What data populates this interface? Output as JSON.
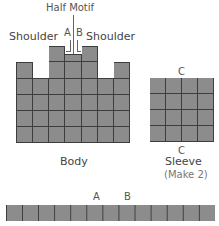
{
  "title": "Half Motif",
  "labels": {
    "shoulder_left": "Shoulder",
    "shoulder_right": "Shoulder",
    "a_top": "A",
    "b_top": "B",
    "c_sleeve_top": "C",
    "c_sleeve_bottom": "C",
    "a_strip": "A",
    "b_strip": "B"
  },
  "pieces": {
    "body": {
      "name": "Body",
      "columns": 7,
      "column_heights": [
        5,
        4,
        6,
        5.5,
        6,
        4,
        5
      ]
    },
    "sleeve": {
      "name": "Sleeve",
      "note": "(Make 2)",
      "columns": 4,
      "rows": 4
    },
    "strip": {
      "columns": 13,
      "rows": 1
    }
  },
  "colors": {
    "block": "#8c8c8c",
    "grid_line": "#3d3d3d",
    "text": "#555555"
  }
}
